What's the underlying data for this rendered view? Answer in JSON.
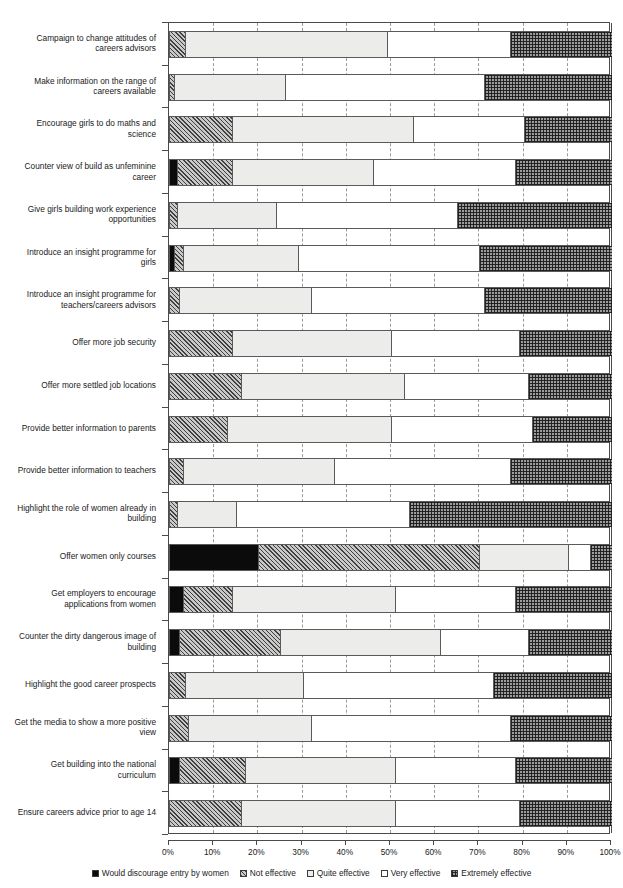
{
  "chart_data": {
    "type": "bar",
    "orientation": "horizontal",
    "stacked": true,
    "normalized": true,
    "title": "",
    "xlabel": "",
    "ylabel": "",
    "xlim": [
      0,
      100
    ],
    "grid": true,
    "legend_position": "bottom",
    "xticks": [
      "0%",
      "10%",
      "20%",
      "30%",
      "40%",
      "50%",
      "60%",
      "70%",
      "80%",
      "90%",
      "100%"
    ],
    "xtick_values": [
      0,
      10,
      20,
      30,
      40,
      50,
      60,
      70,
      80,
      90,
      100
    ],
    "series": [
      {
        "name": "Would discourage entry by women",
        "pattern": "solid-black",
        "color": "#0b0b0b",
        "values": [
          0,
          0,
          0,
          1.5,
          0,
          1,
          0,
          0,
          0,
          0,
          0,
          0,
          20,
          3,
          2,
          0,
          0,
          2,
          0
        ]
      },
      {
        "name": "Not effective",
        "pattern": "diagonal-hatch",
        "color": "#c9c9c9",
        "values": [
          3.5,
          1,
          14,
          12.5,
          1.5,
          2,
          2,
          14,
          16,
          13,
          3,
          1.5,
          50,
          11,
          23,
          3.5,
          4,
          15,
          16
        ]
      },
      {
        "name": "Quite effective",
        "pattern": "light-grey",
        "color": "#ececeb",
        "values": [
          45.5,
          25,
          41,
          32,
          22.5,
          26,
          30,
          36,
          37,
          37,
          34,
          13.5,
          20,
          37,
          36,
          26.5,
          28,
          34,
          35
        ]
      },
      {
        "name": "Very effective",
        "pattern": "white",
        "color": "#ffffff",
        "values": [
          28,
          45,
          25,
          32,
          41,
          41,
          39,
          29,
          28,
          32,
          40,
          39,
          5,
          27,
          20,
          43,
          45,
          27,
          28
        ]
      },
      {
        "name": "Extremely effective",
        "pattern": "cross-hatch",
        "color": "#9c9c9c",
        "values": [
          23,
          29,
          20,
          22,
          35,
          30,
          29,
          21,
          19,
          18,
          23,
          46,
          5,
          22,
          19,
          27,
          23,
          22,
          21
        ]
      }
    ],
    "categories": [
      "Campaign to change attitudes of careers advisors",
      "Make information on the range of careers available",
      "Encourage girls to do maths and science",
      "Counter view of build as unfeminine career",
      "Give girls building work experience opportunities",
      "Introduce an insight programme for girls",
      "Introduce an insight programme for teachers/careers advisors",
      "Offer more job security",
      "Offer more settled job locations",
      "Provide better information to parents",
      "Provide better information to teachers",
      "Highlight the role of women already in building",
      "Offer women only courses",
      "Get employers to encourage applications from women",
      "Counter the dirty dangerous image of building",
      "Highlight the good career prospects",
      "Get the media to show a more positive view",
      "Get building into the national curriculum",
      "Ensure careers advice prior to age 14"
    ],
    "category_lines": [
      [
        "Campaign to change attitudes of",
        "careers advisors"
      ],
      [
        "Make information on the range of",
        "careers available"
      ],
      [
        "Encourage girls to do maths and",
        "science"
      ],
      [
        "Counter view of build as unfeminine",
        "career"
      ],
      [
        "Give girls building work experience",
        "opportunities"
      ],
      [
        "Introduce an insight programme for",
        "girls"
      ],
      [
        "Introduce an insight programme for",
        "teachers/careers advisors"
      ],
      [
        "Offer more job security"
      ],
      [
        "Offer more settled job locations"
      ],
      [
        "Provide better information to parents"
      ],
      [
        "Provide better information to teachers"
      ],
      [
        "Highlight the role of women already in",
        "building"
      ],
      [
        "Offer women only courses"
      ],
      [
        "Get employers to encourage",
        "applications from women"
      ],
      [
        "Counter the dirty dangerous image of",
        "building"
      ],
      [
        "Highlight the good career prospects"
      ],
      [
        "Get the media to show a more positive",
        "view"
      ],
      [
        "Get building into the national",
        "curriculum"
      ],
      [
        "Ensure careers advice prior to age 14"
      ]
    ]
  },
  "legend": {
    "items": [
      {
        "label": "Would discourage entry by women",
        "swatch": "solid-black-swatch"
      },
      {
        "label": "Not effective",
        "swatch": "diagonal-hatch-swatch"
      },
      {
        "label": "Quite effective",
        "swatch": "light-grey-swatch"
      },
      {
        "label": "Very effective",
        "swatch": "white-swatch"
      },
      {
        "label": "Extremely effective",
        "swatch": "cross-hatch-swatch"
      }
    ]
  }
}
